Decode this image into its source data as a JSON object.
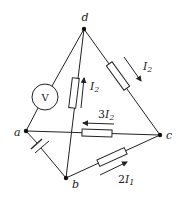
{
  "diagram": {
    "type": "circuit",
    "nodes": [
      {
        "id": "a",
        "label": "a"
      },
      {
        "id": "b",
        "label": "b"
      },
      {
        "id": "c",
        "label": "c"
      },
      {
        "id": "d",
        "label": "d"
      }
    ],
    "components": [
      {
        "id": "voltmeter",
        "kind": "voltmeter",
        "between": [
          "a",
          "d"
        ],
        "label": "V"
      },
      {
        "id": "battery",
        "kind": "cell",
        "between": [
          "a",
          "b"
        ]
      },
      {
        "id": "R_db",
        "kind": "resistor",
        "between": [
          "b",
          "d"
        ],
        "current_label": "I₂",
        "current_direction": "b→d"
      },
      {
        "id": "R_dc",
        "kind": "resistor",
        "between": [
          "d",
          "c"
        ],
        "current_label": "I₂",
        "current_direction": "d→c"
      },
      {
        "id": "R_ac",
        "kind": "resistor",
        "between": [
          "a",
          "c"
        ],
        "current_label": "3I₂",
        "current_direction": "c→a"
      },
      {
        "id": "R_bc",
        "kind": "resistor",
        "between": [
          "b",
          "c"
        ],
        "current_label": "2I₁",
        "current_direction": "b→c"
      }
    ],
    "labels": {
      "node_a": "a",
      "node_b": "b",
      "node_c": "c",
      "node_d": "d",
      "voltmeter": "V",
      "i_db_base": "I",
      "i_db_sub": "2",
      "i_dc_base": "I",
      "i_dc_sub": "2",
      "i_ac_coef": "3",
      "i_ac_base": "I",
      "i_ac_sub": "2",
      "i_bc_coef": "2",
      "i_bc_base": "I",
      "i_bc_sub": "1"
    }
  }
}
